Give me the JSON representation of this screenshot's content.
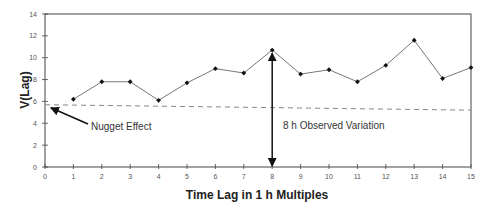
{
  "chart_data": {
    "type": "line",
    "title": "",
    "xlabel": "Time Lag in 1 h Multiples",
    "ylabel": "V(Lag)",
    "xlim": [
      0,
      15
    ],
    "ylim": [
      0,
      14
    ],
    "x_ticks": [
      0,
      1,
      2,
      3,
      4,
      5,
      6,
      7,
      8,
      9,
      10,
      11,
      12,
      13,
      14,
      15
    ],
    "y_ticks": [
      0,
      2,
      4,
      6,
      8,
      10,
      12,
      14
    ],
    "grid": false,
    "legend": null,
    "series": [
      {
        "name": "V(Lag)",
        "style": "solid line with diamond markers",
        "x": [
          1,
          2,
          3,
          4,
          5,
          6,
          7,
          8,
          9,
          10,
          11,
          12,
          13,
          14,
          15
        ],
        "values": [
          6.2,
          7.8,
          7.8,
          6.1,
          7.7,
          9.0,
          8.6,
          10.7,
          8.5,
          8.9,
          7.8,
          9.3,
          11.6,
          8.1,
          9.1
        ]
      },
      {
        "name": "Trend",
        "style": "dashed",
        "x": [
          0,
          15
        ],
        "values": [
          5.7,
          5.2
        ]
      }
    ],
    "annotations": [
      {
        "text": "Nugget Effect",
        "arrow_to": [
          0.1,
          5.6
        ],
        "text_at": [
          1.6,
          4.0
        ]
      },
      {
        "text": "8 h Observed Variation",
        "double_arrow_x": 8,
        "from": 0,
        "to": 10.7,
        "text_at": [
          8.4,
          3.7
        ]
      }
    ]
  },
  "colors": {
    "line": "#777777",
    "marker": "#111111",
    "axis": "#444444",
    "dashed": "#888888",
    "arrow": "#111111"
  }
}
